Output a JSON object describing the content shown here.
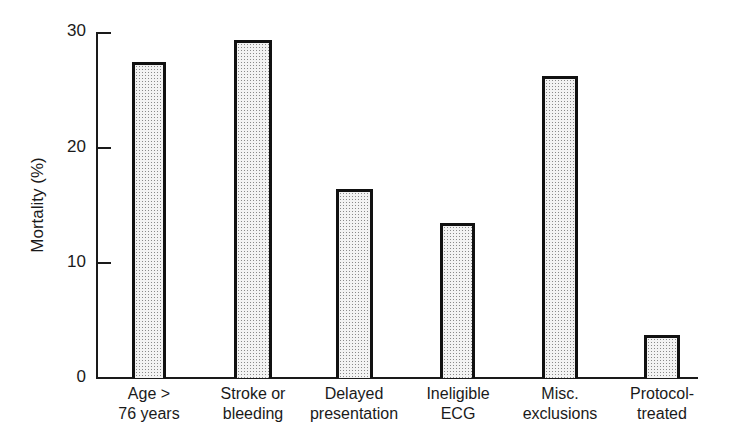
{
  "chart_data": {
    "type": "bar",
    "title": "",
    "xlabel": "",
    "ylabel": "Mortality (%)",
    "ylim": [
      0,
      30
    ],
    "yticks": [
      0,
      10,
      20,
      30
    ],
    "grid": false,
    "legend": null,
    "categories": [
      "Age > 76 years",
      "Stroke or bleeding",
      "Delayed presentation",
      "Ineligible ECG",
      "Misc. exclusions",
      "Protocol-treated"
    ],
    "category_lines": [
      [
        "Age >",
        "76 years"
      ],
      [
        "Stroke or",
        "bleeding"
      ],
      [
        "Delayed",
        "presentation"
      ],
      [
        "Ineligible",
        "ECG"
      ],
      [
        "Misc.",
        "exclusions"
      ],
      [
        "Protocol-",
        "treated"
      ]
    ],
    "values": [
      27.4,
      29.3,
      16.4,
      13.4,
      26.2,
      3.7
    ]
  },
  "axis": {
    "y_title": "Mortality (%)",
    "tick_labels": [
      "0",
      "10",
      "20",
      "30"
    ]
  },
  "style": {
    "bar_border": "#111111",
    "bar_fill": "#f3f3f3",
    "bar_stipple": "#8a8a8a"
  }
}
